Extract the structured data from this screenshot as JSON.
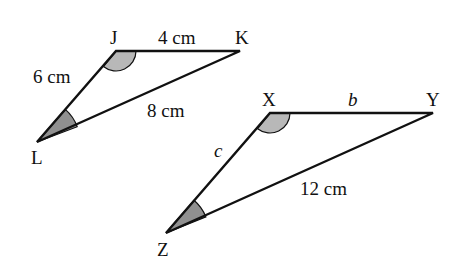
{
  "diagram": {
    "type": "similar-triangles",
    "triangles": [
      {
        "name": "JKL",
        "vertices": {
          "J": {
            "label": "J",
            "x": 116,
            "y": 51
          },
          "K": {
            "label": "K",
            "x": 240,
            "y": 51
          },
          "L": {
            "label": "L",
            "x": 37,
            "y": 142
          }
        },
        "sides": {
          "JK": "4 cm",
          "JL": "6 cm",
          "KL": "8 cm"
        },
        "marked_angles": [
          "J",
          "L"
        ]
      },
      {
        "name": "XYZ",
        "vertices": {
          "X": {
            "label": "X",
            "x": 270,
            "y": 113
          },
          "Y": {
            "label": "Y",
            "x": 433,
            "y": 113
          },
          "Z": {
            "label": "Z",
            "x": 166,
            "y": 233
          }
        },
        "sides": {
          "XY": "b",
          "XZ": "c",
          "YZ": "12 cm"
        },
        "marked_angles": [
          "X",
          "Z"
        ]
      }
    ],
    "colors": {
      "line": "#111111",
      "angle_fill_light": "#b8b8b8",
      "angle_fill_dark": "#909090",
      "background": "#ffffff"
    }
  }
}
